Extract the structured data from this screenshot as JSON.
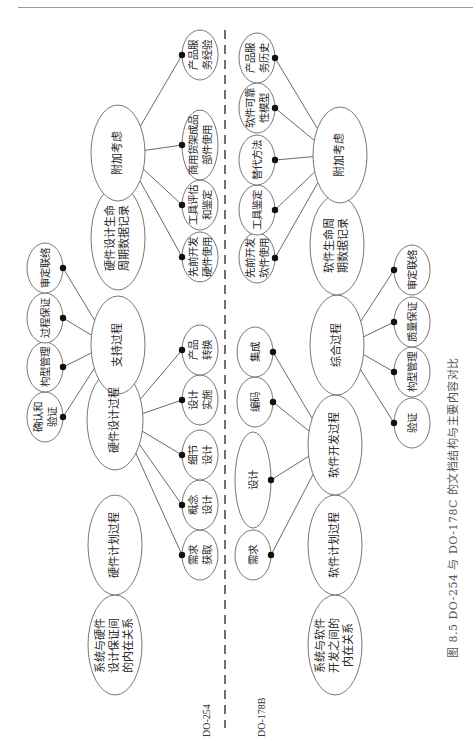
{
  "figure": {
    "caption": "图 8.5   DO-254 与 DO-178C 的文档结构与主要内容对比",
    "rotation": "-90deg"
  },
  "standards": {
    "left": "DO-254",
    "right": "DO-178B"
  },
  "colors": {
    "stroke": "#555555",
    "dot": "#111111",
    "text": "#2a2a2a",
    "divider": "#333333"
  },
  "do254": {
    "main": [
      {
        "id": "h_sys",
        "label": "系统与硬件\n设计保证间\n的内在关系",
        "cx": 115,
        "cy": 645,
        "rx": 27,
        "ry": 50
      },
      {
        "id": "h_plan",
        "label": "硬件计划过程",
        "cx": 115,
        "cy": 545,
        "rx": 27,
        "ry": 50
      },
      {
        "id": "h_design",
        "label": "硬件设计过程",
        "cx": 115,
        "cy": 420,
        "rx": 28,
        "ry": 50
      },
      {
        "id": "h_support",
        "label": "支持过程",
        "cx": 118,
        "cy": 345,
        "rx": 27,
        "ry": 49
      },
      {
        "id": "h_data",
        "label": "硬件设计生命\n周期数据记录",
        "cx": 118,
        "cy": 238,
        "rx": 27,
        "ry": 52
      },
      {
        "id": "h_add",
        "label": "附加考虑",
        "cx": 118,
        "cy": 153,
        "rx": 27,
        "ry": 48
      }
    ],
    "leaves": [
      {
        "id": "h_req",
        "label": "需求\n获取",
        "cx": 200,
        "cy": 555,
        "rx": 18,
        "ry": 25,
        "parent": "h_design"
      },
      {
        "id": "h_concept",
        "label": "概念\n设计",
        "cx": 200,
        "cy": 505,
        "rx": 18,
        "ry": 25,
        "parent": "h_design"
      },
      {
        "id": "h_detail",
        "label": "细节\n设计",
        "cx": 200,
        "cy": 455,
        "rx": 18,
        "ry": 25,
        "parent": "h_design"
      },
      {
        "id": "h_impl",
        "label": "设计\n实施",
        "cx": 200,
        "cy": 400,
        "rx": 18,
        "ry": 25,
        "parent": "h_design"
      },
      {
        "id": "h_prod",
        "label": "产品\n转换",
        "cx": 200,
        "cy": 350,
        "rx": 18,
        "ry": 25,
        "parent": "h_design"
      },
      {
        "id": "h_vv",
        "label": "确认和\n验证",
        "cx": 45,
        "cy": 417,
        "rx": 18,
        "ry": 25,
        "parent": "h_support"
      },
      {
        "id": "h_cm",
        "label": "构型管理",
        "cx": 45,
        "cy": 367,
        "rx": 18,
        "ry": 25,
        "parent": "h_support"
      },
      {
        "id": "h_pa",
        "label": "过程保证",
        "cx": 45,
        "cy": 318,
        "rx": 18,
        "ry": 25,
        "parent": "h_support"
      },
      {
        "id": "h_cl",
        "label": "审定联络",
        "cx": 45,
        "cy": 268,
        "rx": 18,
        "ry": 25,
        "parent": "h_support"
      },
      {
        "id": "h_prev",
        "label": "先前开发\n硬件使用",
        "cx": 200,
        "cy": 257,
        "rx": 18,
        "ry": 25,
        "parent": "h_add"
      },
      {
        "id": "h_tool",
        "label": "工具评估\n和鉴定",
        "cx": 200,
        "cy": 205,
        "rx": 18,
        "ry": 25,
        "parent": "h_add"
      },
      {
        "id": "h_cots",
        "label": "商用货架成品\n部件使用",
        "cx": 200,
        "cy": 145,
        "rx": 18,
        "ry": 35,
        "parent": "h_add"
      },
      {
        "id": "h_svc",
        "label": "产品服\n务经验",
        "cx": 200,
        "cy": 55,
        "rx": 18,
        "ry": 25,
        "parent": "h_add"
      }
    ]
  },
  "do178b": {
    "main": [
      {
        "id": "s_sys",
        "label": "系统与软件\n开发之间的\n内在关系",
        "cx": 335,
        "cy": 645,
        "rx": 27,
        "ry": 50
      },
      {
        "id": "s_plan",
        "label": "软件计划过程",
        "cx": 335,
        "cy": 545,
        "rx": 27,
        "ry": 50
      },
      {
        "id": "s_dev",
        "label": "软件开发过程",
        "cx": 335,
        "cy": 445,
        "rx": 27,
        "ry": 50
      },
      {
        "id": "s_integ",
        "label": "综合过程",
        "cx": 337,
        "cy": 345,
        "rx": 27,
        "ry": 50
      },
      {
        "id": "s_data",
        "label": "软件生命周\n期数据记录",
        "cx": 337,
        "cy": 245,
        "rx": 27,
        "ry": 50
      },
      {
        "id": "s_add",
        "label": "附加考虑",
        "cx": 340,
        "cy": 155,
        "rx": 27,
        "ry": 48
      }
    ],
    "leaves": [
      {
        "id": "s_req",
        "label": "需求",
        "cx": 253,
        "cy": 555,
        "rx": 18,
        "ry": 25,
        "parent": "s_dev"
      },
      {
        "id": "s_design",
        "label": "设计",
        "cx": 253,
        "cy": 480,
        "rx": 18,
        "ry": 48,
        "parent": "s_dev"
      },
      {
        "id": "s_code",
        "label": "编码",
        "cx": 255,
        "cy": 402,
        "rx": 18,
        "ry": 25,
        "parent": "s_dev"
      },
      {
        "id": "s_int",
        "label": "集成",
        "cx": 255,
        "cy": 352,
        "rx": 18,
        "ry": 25,
        "parent": "s_dev"
      },
      {
        "id": "s_verif",
        "label": "验证",
        "cx": 412,
        "cy": 423,
        "rx": 18,
        "ry": 25,
        "parent": "s_integ"
      },
      {
        "id": "s_cm",
        "label": "构型管理",
        "cx": 412,
        "cy": 372,
        "rx": 18,
        "ry": 25,
        "parent": "s_integ"
      },
      {
        "id": "s_qa",
        "label": "质量保证",
        "cx": 412,
        "cy": 322,
        "rx": 18,
        "ry": 25,
        "parent": "s_integ"
      },
      {
        "id": "s_cl",
        "label": "审定联络",
        "cx": 412,
        "cy": 270,
        "rx": 18,
        "ry": 25,
        "parent": "s_integ"
      },
      {
        "id": "s_prev",
        "label": "先前开发\n软件使用",
        "cx": 257,
        "cy": 258,
        "rx": 18,
        "ry": 25,
        "parent": "s_add"
      },
      {
        "id": "s_tool",
        "label": "工具鉴定",
        "cx": 257,
        "cy": 210,
        "rx": 18,
        "ry": 25,
        "parent": "s_add"
      },
      {
        "id": "s_alt",
        "label": "替代方法",
        "cx": 257,
        "cy": 160,
        "rx": 18,
        "ry": 25,
        "parent": "s_add"
      },
      {
        "id": "s_rel",
        "label": "软件可靠\n性模型",
        "cx": 257,
        "cy": 108,
        "rx": 18,
        "ry": 25,
        "parent": "s_add"
      },
      {
        "id": "s_svc",
        "label": "产品服\n务历史",
        "cx": 257,
        "cy": 58,
        "rx": 18,
        "ry": 25,
        "parent": "s_add"
      }
    ]
  }
}
